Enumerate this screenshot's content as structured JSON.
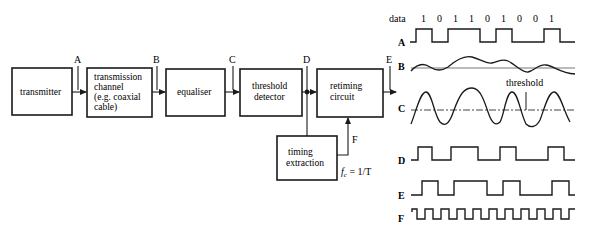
{
  "blocks": {
    "transmitter": {
      "lines": [
        "transmitter"
      ]
    },
    "channel": {
      "lines": [
        "transmission",
        "channel",
        "(e.g. coaxial",
        "cable)"
      ]
    },
    "equaliser": {
      "lines": [
        "equaliser"
      ]
    },
    "threshold_detector": {
      "lines": [
        "threshold",
        "detector"
      ]
    },
    "retiming_circuit": {
      "lines": [
        "retiming",
        "circuit"
      ]
    },
    "timing_extraction": {
      "lines": [
        "timing",
        "extraction"
      ]
    }
  },
  "points": {
    "A": "A",
    "B": "B",
    "C": "C",
    "D": "D",
    "E": "E",
    "F": "F"
  },
  "clock_formula": "f",
  "clock_formula_sub": "c",
  "clock_formula_rhs": " = 1/T",
  "waveforms": {
    "data_label": "data",
    "data_bits": [
      "1",
      "0",
      "1",
      "1",
      "0",
      "1",
      "0",
      "0",
      "1"
    ],
    "labels": [
      "A",
      "B",
      "C",
      "D",
      "E",
      "F"
    ],
    "threshold_label": "threshold"
  },
  "colors": {
    "ink": "#1a1a1a",
    "background": "#ffffff",
    "grey_line": "#777777"
  }
}
